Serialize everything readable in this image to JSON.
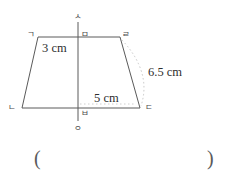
{
  "figure": {
    "type": "trapezoid-with-axis",
    "vertex_labels": {
      "top_left": "ㄱ",
      "bottom_left": "ㄴ",
      "bottom_right": "ㄷ",
      "top_right": "ㄹ",
      "top_mid": "ㅁ",
      "bottom_mid": "ㅂ",
      "axis_top": "ㅅ",
      "axis_bottom": "ㅇ"
    },
    "measurements": {
      "left_top_side": "3 cm",
      "right_slant_side": "6.5 cm",
      "bottom_right_half": "5 cm"
    },
    "answer_blank": {
      "open": "(",
      "close": ")"
    },
    "colors": {
      "stroke": "#5a5a5a",
      "text": "#2e2e2e",
      "label": "#4a4a4a",
      "arc": "#bcbcbc",
      "background": "#ffffff"
    },
    "geometry": {
      "top_left_point": [
        38,
        37
      ],
      "top_right_point": [
        120,
        37
      ],
      "bottom_left_point": [
        22,
        108
      ],
      "bottom_right_point": [
        140,
        108
      ],
      "axis_x": 78,
      "axis_top_y": 22,
      "axis_bottom_y": 121
    }
  }
}
